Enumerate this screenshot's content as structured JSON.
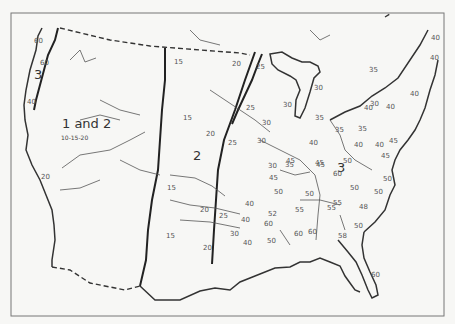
{
  "map": {
    "zones": [
      {
        "label": "3",
        "x": 34,
        "y": 79
      },
      {
        "label": "1 and 2",
        "x": 62,
        "y": 128
      },
      {
        "label": "2",
        "x": 193,
        "y": 160
      },
      {
        "label": "3",
        "x": 337,
        "y": 172
      }
    ],
    "zone_subtitle": {
      "text": "10-15-20",
      "x": 61,
      "y": 140
    },
    "values": [
      {
        "v": "60",
        "x": 40,
        "y": 65
      },
      {
        "v": "60",
        "x": 34,
        "y": 43
      },
      {
        "v": "40",
        "x": 27,
        "y": 104
      },
      {
        "v": "20",
        "x": 41,
        "y": 179
      },
      {
        "v": "15",
        "x": 174,
        "y": 64
      },
      {
        "v": "20",
        "x": 232,
        "y": 66
      },
      {
        "v": "25",
        "x": 256,
        "y": 69
      },
      {
        "v": "30",
        "x": 283,
        "y": 107
      },
      {
        "v": "30",
        "x": 314,
        "y": 90
      },
      {
        "v": "15",
        "x": 183,
        "y": 120
      },
      {
        "v": "20",
        "x": 206,
        "y": 136
      },
      {
        "v": "25",
        "x": 246,
        "y": 110
      },
      {
        "v": "25",
        "x": 228,
        "y": 145
      },
      {
        "v": "30",
        "x": 262,
        "y": 125
      },
      {
        "v": "30",
        "x": 257,
        "y": 143
      },
      {
        "v": "30",
        "x": 268,
        "y": 168
      },
      {
        "v": "35",
        "x": 285,
        "y": 167
      },
      {
        "v": "35",
        "x": 315,
        "y": 120
      },
      {
        "v": "35",
        "x": 335,
        "y": 132
      },
      {
        "v": "35",
        "x": 358,
        "y": 131
      },
      {
        "v": "35",
        "x": 369,
        "y": 72
      },
      {
        "v": "30",
        "x": 370,
        "y": 106
      },
      {
        "v": "40",
        "x": 364,
        "y": 110
      },
      {
        "v": "40",
        "x": 386,
        "y": 109
      },
      {
        "v": "40",
        "x": 410,
        "y": 96
      },
      {
        "v": "40",
        "x": 431,
        "y": 40
      },
      {
        "v": "40",
        "x": 430,
        "y": 60
      },
      {
        "v": "40",
        "x": 309,
        "y": 145
      },
      {
        "v": "40",
        "x": 354,
        "y": 147
      },
      {
        "v": "40",
        "x": 375,
        "y": 147
      },
      {
        "v": "45",
        "x": 286,
        "y": 163
      },
      {
        "v": "45",
        "x": 315,
        "y": 165
      },
      {
        "v": "45",
        "x": 269,
        "y": 180
      },
      {
        "v": "45",
        "x": 316,
        "y": 167
      },
      {
        "v": "45",
        "x": 381,
        "y": 158
      },
      {
        "v": "45",
        "x": 389,
        "y": 143
      },
      {
        "v": "50",
        "x": 274,
        "y": 194
      },
      {
        "v": "50",
        "x": 305,
        "y": 196
      },
      {
        "v": "50",
        "x": 343,
        "y": 163
      },
      {
        "v": "50",
        "x": 350,
        "y": 190
      },
      {
        "v": "50",
        "x": 383,
        "y": 181
      },
      {
        "v": "50",
        "x": 374,
        "y": 194
      },
      {
        "v": "55",
        "x": 295,
        "y": 212
      },
      {
        "v": "55",
        "x": 327,
        "y": 210
      },
      {
        "v": "55",
        "x": 333,
        "y": 205
      },
      {
        "v": "60",
        "x": 333,
        "y": 176
      },
      {
        "v": "48",
        "x": 359,
        "y": 209
      },
      {
        "v": "50",
        "x": 354,
        "y": 228
      },
      {
        "v": "15",
        "x": 167,
        "y": 190
      },
      {
        "v": "15",
        "x": 166,
        "y": 238
      },
      {
        "v": "20",
        "x": 200,
        "y": 212
      },
      {
        "v": "20",
        "x": 203,
        "y": 250
      },
      {
        "v": "25",
        "x": 219,
        "y": 218
      },
      {
        "v": "30",
        "x": 230,
        "y": 236
      },
      {
        "v": "40",
        "x": 245,
        "y": 206
      },
      {
        "v": "40",
        "x": 241,
        "y": 222
      },
      {
        "v": "40",
        "x": 243,
        "y": 245
      },
      {
        "v": "52",
        "x": 268,
        "y": 216
      },
      {
        "v": "50",
        "x": 267,
        "y": 243
      },
      {
        "v": "60",
        "x": 294,
        "y": 236
      },
      {
        "v": "60",
        "x": 264,
        "y": 226
      },
      {
        "v": "60",
        "x": 308,
        "y": 234
      },
      {
        "v": "58",
        "x": 338,
        "y": 238
      },
      {
        "v": "60",
        "x": 371,
        "y": 277
      }
    ]
  }
}
